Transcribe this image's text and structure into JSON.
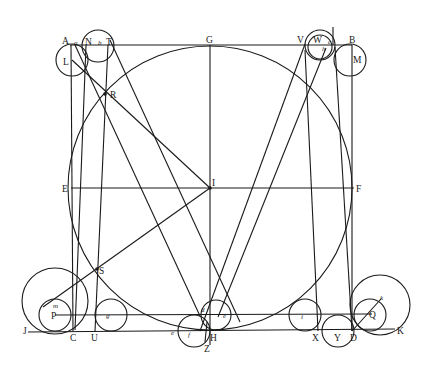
{
  "diagram": {
    "colors": {
      "ink": "#1a1a1a",
      "background": "#ffffff"
    },
    "points": [
      {
        "id": "A",
        "label": "A",
        "x": 70,
        "y": 45
      },
      {
        "id": "B",
        "label": "B",
        "x": 352,
        "y": 45
      },
      {
        "id": "C",
        "label": "C",
        "x": 73,
        "y": 331
      },
      {
        "id": "D",
        "label": "D",
        "x": 352,
        "y": 331
      },
      {
        "id": "E",
        "label": "E",
        "x": 71,
        "y": 188
      },
      {
        "id": "F",
        "label": "F",
        "x": 353,
        "y": 188
      },
      {
        "id": "G",
        "label": "G",
        "x": 210,
        "y": 45
      },
      {
        "id": "H",
        "label": "H",
        "x": 210,
        "y": 331
      },
      {
        "id": "I",
        "label": "I",
        "x": 210,
        "y": 188
      },
      {
        "id": "J",
        "label": "J",
        "x": 28,
        "y": 331
      },
      {
        "id": "K",
        "label": "K",
        "x": 395,
        "y": 330
      },
      {
        "id": "L",
        "label": "L",
        "x": 72,
        "y": 61
      },
      {
        "id": "M",
        "label": "M",
        "x": 351,
        "y": 60
      },
      {
        "id": "N",
        "label": "N",
        "x": 89,
        "y": 44
      },
      {
        "id": "T",
        "label": "T",
        "x": 109,
        "y": 44
      },
      {
        "id": "V",
        "label": "V",
        "x": 302,
        "y": 44
      },
      {
        "id": "W",
        "label": "W",
        "x": 320,
        "y": 44
      },
      {
        "id": "R",
        "label": "R",
        "x": 105,
        "y": 94
      },
      {
        "id": "S",
        "label": "S",
        "x": 97,
        "y": 269
      },
      {
        "id": "P",
        "label": "P",
        "x": 55,
        "y": 315
      },
      {
        "id": "Q",
        "label": "Q",
        "x": 372,
        "y": 315
      },
      {
        "id": "U",
        "label": "U",
        "x": 95,
        "y": 331
      },
      {
        "id": "X",
        "label": "X",
        "x": 318,
        "y": 331
      },
      {
        "id": "Y",
        "label": "Y",
        "x": 338,
        "y": 331
      },
      {
        "id": "Z",
        "label": "Z",
        "x": 208,
        "y": 345
      }
    ],
    "labels": [
      {
        "text": "A",
        "x": 62,
        "y": 44
      },
      {
        "text": "a",
        "x": 74,
        "y": 45,
        "small": true
      },
      {
        "text": "N",
        "x": 85,
        "y": 45
      },
      {
        "text": "b",
        "x": 98,
        "y": 45,
        "small": true
      },
      {
        "text": "T",
        "x": 106,
        "y": 45
      },
      {
        "text": "G",
        "x": 206,
        "y": 43
      },
      {
        "text": "V",
        "x": 297,
        "y": 43
      },
      {
        "text": "W",
        "x": 313,
        "y": 43
      },
      {
        "text": "c",
        "x": 328,
        "y": 44,
        "small": true
      },
      {
        "text": "h",
        "x": 322,
        "y": 51,
        "small": true
      },
      {
        "text": "B",
        "x": 349,
        "y": 43
      },
      {
        "text": "L",
        "x": 63,
        "y": 65
      },
      {
        "text": "M",
        "x": 353,
        "y": 63
      },
      {
        "text": "R",
        "x": 110,
        "y": 98
      },
      {
        "text": "E",
        "x": 62,
        "y": 192
      },
      {
        "text": "I",
        "x": 212,
        "y": 186
      },
      {
        "text": "F",
        "x": 356,
        "y": 192
      },
      {
        "text": "S",
        "x": 99,
        "y": 274
      },
      {
        "text": "m",
        "x": 53,
        "y": 308,
        "small": true
      },
      {
        "text": "P",
        "x": 51,
        "y": 319
      },
      {
        "text": "g",
        "x": 106,
        "y": 318,
        "small": true
      },
      {
        "text": "d",
        "x": 201,
        "y": 312,
        "small": true
      },
      {
        "text": "e",
        "x": 223,
        "y": 318,
        "small": true
      },
      {
        "text": "i",
        "x": 301,
        "y": 319,
        "small": true
      },
      {
        "text": "k",
        "x": 380,
        "y": 300,
        "small": true
      },
      {
        "text": "Q",
        "x": 369,
        "y": 318
      },
      {
        "text": "J",
        "x": 23,
        "y": 334
      },
      {
        "text": "C",
        "x": 70,
        "y": 341
      },
      {
        "text": "U",
        "x": 91,
        "y": 341
      },
      {
        "text": "e",
        "x": 171,
        "y": 335,
        "small": true
      },
      {
        "text": "f",
        "x": 188,
        "y": 337,
        "small": true
      },
      {
        "text": "H",
        "x": 210,
        "y": 341
      },
      {
        "text": "Z",
        "x": 204,
        "y": 352
      },
      {
        "text": "X",
        "x": 312,
        "y": 341
      },
      {
        "text": "Y",
        "x": 334,
        "y": 341
      },
      {
        "text": "D",
        "x": 350,
        "y": 341
      },
      {
        "text": "K",
        "x": 397,
        "y": 334
      }
    ],
    "circles": [
      {
        "name": "main-circle",
        "cx": 210,
        "cy": 188,
        "r": 142
      },
      {
        "name": "circle-L",
        "cx": 72,
        "cy": 60,
        "r": 16
      },
      {
        "name": "circle-NT",
        "cx": 98,
        "cy": 46,
        "r": 16
      },
      {
        "name": "circle-W-outer",
        "cx": 320,
        "cy": 45,
        "r": 15
      },
      {
        "name": "circle-W-inner",
        "cx": 320,
        "cy": 47,
        "r": 12
      },
      {
        "name": "circle-M",
        "cx": 350,
        "cy": 60,
        "r": 16
      },
      {
        "name": "circle-P-large",
        "cx": 55,
        "cy": 301,
        "r": 33
      },
      {
        "name": "circle-P-small",
        "cx": 55,
        "cy": 315,
        "r": 16
      },
      {
        "name": "circle-g",
        "cx": 111,
        "cy": 315,
        "r": 16
      },
      {
        "name": "circle-f",
        "cx": 194,
        "cy": 331,
        "r": 16
      },
      {
        "name": "circle-e",
        "cx": 216,
        "cy": 315,
        "r": 15
      },
      {
        "name": "circle-i",
        "cx": 305,
        "cy": 315,
        "r": 16
      },
      {
        "name": "circle-Y",
        "cx": 338,
        "cy": 331,
        "r": 16
      },
      {
        "name": "circle-Q-small",
        "cx": 370,
        "cy": 315,
        "r": 16
      },
      {
        "name": "circle-Q-large",
        "cx": 380,
        "cy": 305,
        "r": 30
      }
    ],
    "lines": [
      {
        "name": "top-edge-AB",
        "x1": 70,
        "y1": 45,
        "x2": 352,
        "y2": 45
      },
      {
        "name": "left-edge-AC",
        "x1": 71,
        "y1": 45,
        "x2": 73,
        "y2": 331
      },
      {
        "name": "right-edge-BD",
        "x1": 352,
        "y1": 45,
        "x2": 352,
        "y2": 331
      },
      {
        "name": "baseline-JK",
        "x1": 28,
        "y1": 332,
        "x2": 395,
        "y2": 329
      },
      {
        "name": "line-PQ",
        "x1": 55,
        "y1": 315,
        "x2": 372,
        "y2": 314
      },
      {
        "name": "axis-GH",
        "x1": 210,
        "y1": 45,
        "x2": 210,
        "y2": 345
      },
      {
        "name": "axis-EF",
        "x1": 71,
        "y1": 188,
        "x2": 354,
        "y2": 188
      },
      {
        "name": "line-LI",
        "x1": 72,
        "y1": 60,
        "x2": 210,
        "y2": 188
      },
      {
        "name": "line-I-m",
        "x1": 210,
        "y1": 188,
        "x2": 43,
        "y2": 307
      },
      {
        "name": "stem-N-C",
        "x1": 86,
        "y1": 45,
        "x2": 75,
        "y2": 330
      },
      {
        "name": "stem-b-U",
        "x1": 108,
        "y1": 45,
        "x2": 95,
        "y2": 331
      },
      {
        "name": "diag-a-d",
        "x1": 75,
        "y1": 45,
        "x2": 200,
        "y2": 316
      },
      {
        "name": "diag-T-e",
        "x1": 110,
        "y1": 40,
        "x2": 240,
        "y2": 322
      },
      {
        "name": "diag-V-H",
        "x1": 305,
        "y1": 44,
        "x2": 200,
        "y2": 331
      },
      {
        "name": "diag-h-e",
        "x1": 326,
        "y1": 48,
        "x2": 218,
        "y2": 317
      },
      {
        "name": "stem-V-X",
        "x1": 305,
        "y1": 50,
        "x2": 318,
        "y2": 331
      },
      {
        "name": "stem-c-D",
        "x1": 335,
        "y1": 47,
        "x2": 352,
        "y2": 331
      },
      {
        "name": "tick-W",
        "x1": 333,
        "y1": 27,
        "x2": 333,
        "y2": 45
      },
      {
        "name": "line-D-k",
        "x1": 352,
        "y1": 331,
        "x2": 381,
        "y2": 299
      },
      {
        "name": "tick-Z",
        "x1": 205,
        "y1": 342,
        "x2": 207,
        "y2": 322
      }
    ]
  }
}
